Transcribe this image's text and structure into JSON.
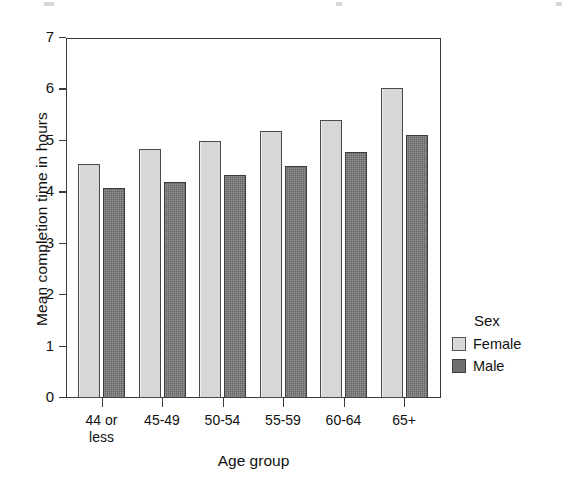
{
  "chart_data": {
    "type": "bar",
    "title": "",
    "xlabel": "Age group",
    "ylabel": "Mean completion time in hours",
    "categories": [
      "44 or less",
      "45-49",
      "50-54",
      "55-59",
      "60-64",
      "65+"
    ],
    "category_lines": [
      [
        "44 or",
        "less"
      ],
      [
        "45-49"
      ],
      [
        "50-54"
      ],
      [
        "55-59"
      ],
      [
        "60-64"
      ],
      [
        "65+"
      ]
    ],
    "series": [
      {
        "name": "Female",
        "color": "#d7d7d7",
        "values": [
          4.55,
          4.84,
          5.0,
          5.2,
          5.41,
          6.03
        ]
      },
      {
        "name": "Male",
        "color": "#6f6f6f",
        "values": [
          4.08,
          4.2,
          4.34,
          4.51,
          4.79,
          5.12
        ]
      }
    ],
    "ylim": [
      0,
      7
    ],
    "yticks": [
      0,
      1,
      2,
      3,
      4,
      5,
      6,
      7
    ],
    "ytick_labels": [
      "0",
      "1",
      "2",
      "3",
      "4",
      "5",
      "6",
      "7"
    ],
    "grid": false,
    "legend": {
      "title": "Sex",
      "position": "right",
      "entries": [
        "Female",
        "Male"
      ]
    }
  }
}
